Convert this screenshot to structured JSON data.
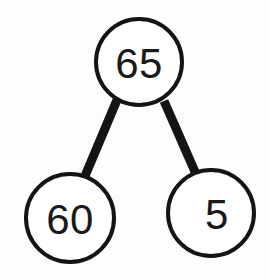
{
  "diagram": {
    "type": "number-bond",
    "background_color": "#fdfdfd",
    "stroke_color": "#141414",
    "fill_color": "#ffffff",
    "text_color": "#1a1a1a",
    "circle_stroke_width": 4,
    "connector_stroke_width": 9,
    "whole": {
      "id": "whole",
      "label": "65",
      "value": 65,
      "cx": 139,
      "cy": 62,
      "r": 43,
      "font_size": 42
    },
    "parts": [
      {
        "id": "part-left",
        "label": "60",
        "value": 60,
        "cx": 70,
        "cy": 218,
        "r": 44,
        "font_size": 42
      },
      {
        "id": "part-right",
        "label": "5",
        "value": 5,
        "cx": 211,
        "cy": 213,
        "r": 43,
        "font_size": 42,
        "label_dx": 6
      }
    ],
    "connectors": [
      {
        "id": "connector-left",
        "from": "whole",
        "to": "part-left",
        "x1": 117,
        "y1": 100,
        "x2": 85,
        "y2": 176
      },
      {
        "id": "connector-right",
        "from": "whole",
        "to": "part-right",
        "x1": 164,
        "y1": 101,
        "x2": 196,
        "y2": 174
      }
    ]
  }
}
